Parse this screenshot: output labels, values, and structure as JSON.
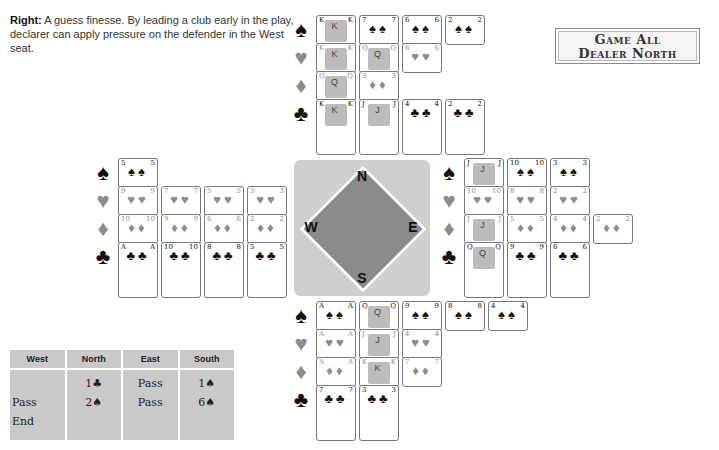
{
  "caption": {
    "lead": "Right:",
    "text": " A guess finesse. By leading a club early in the play, declarer can apply pressure on the defender in the West seat."
  },
  "info_box": {
    "line1": "Game All",
    "line2": "Dealer North"
  },
  "suit_symbols": {
    "spades": "♠",
    "hearts": "♥",
    "diamonds": "♦",
    "clubs": "♣"
  },
  "colors": {
    "black_suit": "#111111",
    "red_suit_gray": "#8c8c8c",
    "compass_dark": "#8a8a8a",
    "compass_light": "#cfcfcf",
    "table_bg": "#c9c9c9"
  },
  "hands": {
    "north": {
      "spades": [
        "K",
        "7",
        "6",
        "2"
      ],
      "hearts": [
        "K",
        "Q",
        "6"
      ],
      "diamonds": [
        "Q",
        "3"
      ],
      "clubs": [
        "K",
        "J",
        "4",
        "2"
      ]
    },
    "west": {
      "spades": [
        "5"
      ],
      "hearts": [
        "9",
        "7",
        "5",
        "3"
      ],
      "diamonds": [
        "10",
        "9",
        "6",
        "2"
      ],
      "clubs": [
        "A",
        "10",
        "8",
        "5"
      ]
    },
    "east": {
      "spades": [
        "J",
        "10",
        "3"
      ],
      "hearts": [
        "10",
        "8",
        "2"
      ],
      "diamonds": [
        "J",
        "5",
        "4",
        "2"
      ],
      "clubs": [
        "Q",
        "9",
        "6"
      ]
    },
    "south": {
      "spades": [
        "A",
        "Q",
        "9",
        "8",
        "4"
      ],
      "hearts": [
        "A",
        "J",
        "4"
      ],
      "diamonds": [
        "A",
        "K",
        "7"
      ],
      "clubs": [
        "7",
        "3"
      ]
    }
  },
  "compass": {
    "n": "N",
    "e": "E",
    "s": "S",
    "w": "W"
  },
  "bidding": {
    "headers": [
      "West",
      "North",
      "East",
      "South"
    ],
    "west": [
      "",
      "Pass",
      "End"
    ],
    "north": [
      "1♣",
      "2♠",
      ""
    ],
    "east": [
      "Pass",
      "Pass",
      ""
    ],
    "south": [
      "1♠",
      "6♠",
      ""
    ]
  }
}
